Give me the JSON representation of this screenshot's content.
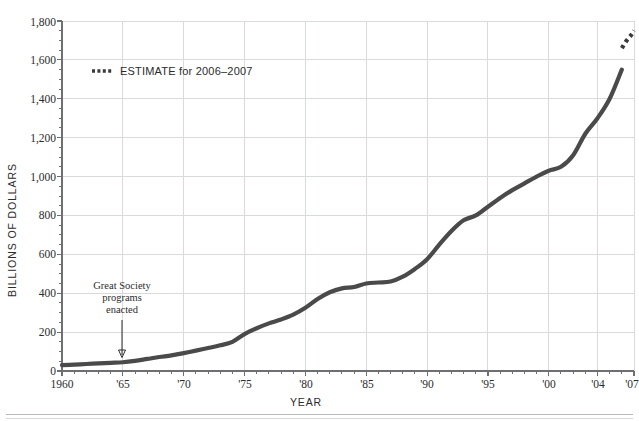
{
  "chart_data": {
    "type": "line",
    "title": "",
    "xlabel": "YEAR",
    "ylabel": "BILLIONS OF DOLLARS",
    "xlim": [
      1960,
      2007
    ],
    "ylim": [
      0,
      1800
    ],
    "grid": true,
    "y_ticks": [
      0,
      200,
      400,
      600,
      800,
      1000,
      1200,
      1400,
      1600,
      1800
    ],
    "y_tick_labels": [
      "0",
      "200",
      "400",
      "600",
      "800",
      "1,000",
      "1,200",
      "1,400",
      "1,600",
      "1,800"
    ],
    "y_minor_step": 50,
    "x_ticks": [
      1960,
      1965,
      1970,
      1975,
      1980,
      1985,
      1990,
      1995,
      2000,
      2004,
      2007
    ],
    "x_tick_labels": [
      "1960",
      "'65",
      "'70",
      "'75",
      "'80",
      "'85",
      "'90",
      "'95",
      "'00",
      "'04",
      "'07"
    ],
    "x_minor_step": 1,
    "line_color": "#4a4a4a",
    "series": [
      {
        "name": "actual",
        "style": "solid",
        "x": [
          1960,
          1961,
          1962,
          1963,
          1964,
          1965,
          1966,
          1967,
          1968,
          1969,
          1970,
          1971,
          1972,
          1973,
          1974,
          1975,
          1976,
          1977,
          1978,
          1979,
          1980,
          1981,
          1982,
          1983,
          1984,
          1985,
          1986,
          1987,
          1988,
          1989,
          1990,
          1991,
          1992,
          1993,
          1994,
          1995,
          1996,
          1997,
          1998,
          1999,
          2000,
          2001,
          2002,
          2003,
          2004,
          2005,
          2006
        ],
        "y": [
          30,
          33,
          36,
          39,
          42,
          45,
          52,
          62,
          72,
          80,
          92,
          105,
          118,
          132,
          150,
          190,
          220,
          245,
          265,
          290,
          325,
          370,
          405,
          425,
          432,
          450,
          455,
          460,
          485,
          525,
          575,
          650,
          720,
          775,
          800,
          845,
          890,
          930,
          965,
          1000,
          1030,
          1050,
          1110,
          1220,
          1300,
          1400,
          1550
        ],
        "unit": "billions of dollars"
      },
      {
        "name": "estimate",
        "style": "dashed",
        "label": "ESTIMATE for 2006–2007",
        "x": [
          2006,
          2006.4,
          2006.8,
          2007
        ],
        "y": [
          1660,
          1700,
          1730,
          1750
        ],
        "unit": "billions of dollars"
      }
    ],
    "annotations": [
      {
        "name": "great-society",
        "lines": [
          "Great Society",
          "programs",
          "enacted"
        ],
        "x": 1965,
        "y": 45,
        "arrow": true
      }
    ],
    "legend": {
      "position": "inside-top-left",
      "entries": [
        {
          "label": "ESTIMATE for 2006–2007",
          "style": "dashed",
          "color": "#3a3a3a"
        }
      ]
    }
  },
  "axes": {
    "y_title": "BILLIONS OF DOLLARS",
    "x_title": "YEAR"
  },
  "legend": {
    "estimate_label": "ESTIMATE for 2006–2007"
  },
  "annotation": {
    "line1": "Great Society",
    "line2": "programs",
    "line3": "enacted"
  },
  "y_labels": {
    "t0": "0",
    "t1": "200",
    "t2": "400",
    "t3": "600",
    "t4": "800",
    "t5": "1,000",
    "t6": "1,200",
    "t7": "1,400",
    "t8": "1,600",
    "t9": "1,800"
  },
  "x_labels": {
    "t0": "1960",
    "t1": "'65",
    "t2": "'70",
    "t3": "'75",
    "t4": "'80",
    "t5": "'85",
    "t6": "'90",
    "t7": "'95",
    "t8": "'00",
    "t9": "'04",
    "t10": "'07"
  }
}
